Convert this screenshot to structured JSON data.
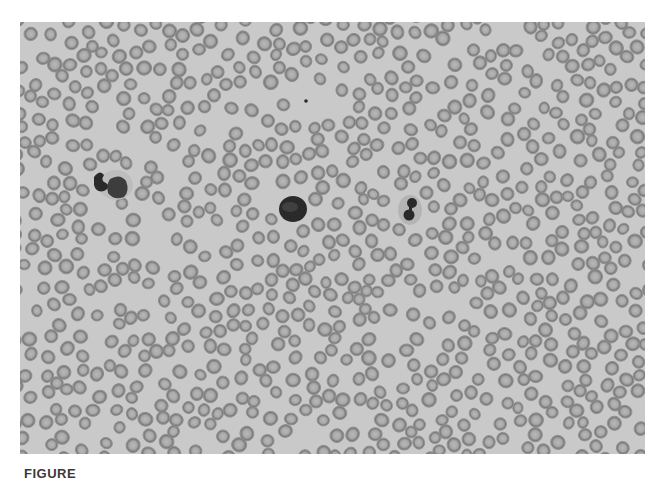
{
  "figure": {
    "caption_visible": "FIGURE",
    "image_description": "Peripheral blood smear micrograph",
    "colors": {
      "background": "#c9c9c9",
      "rbc_rim": "#7a7a7a",
      "rbc_center": "#b8b8b8",
      "nucleus": "#2a2a2a",
      "caption": "#3a3a3a"
    },
    "notable_cells": [
      {
        "type": "neutrophil",
        "cx": 108,
        "cy": 183
      },
      {
        "type": "lymphocyte",
        "cx": 293,
        "cy": 209
      },
      {
        "type": "band-neutrophil",
        "cx": 410,
        "cy": 208
      },
      {
        "type": "small-dot",
        "cx": 306,
        "cy": 101
      }
    ]
  }
}
